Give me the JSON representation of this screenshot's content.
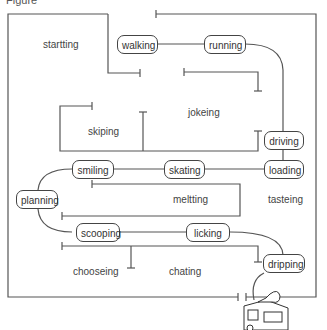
{
  "figure": {
    "title_cut": "Figure",
    "line_color": "#555555",
    "nodes": [
      {
        "id": "walking",
        "label": "walking"
      },
      {
        "id": "running",
        "label": "running"
      },
      {
        "id": "driving",
        "label": "driving"
      },
      {
        "id": "loading",
        "label": "loading"
      },
      {
        "id": "skating",
        "label": "skating"
      },
      {
        "id": "smiling",
        "label": "smiling"
      },
      {
        "id": "planning",
        "label": "planning"
      },
      {
        "id": "scooping",
        "label": "scooping"
      },
      {
        "id": "licking",
        "label": "licking"
      },
      {
        "id": "dripping",
        "label": "dripping"
      }
    ],
    "regions": [
      {
        "id": "startting",
        "label": "startting"
      },
      {
        "id": "jokeing",
        "label": "jokeing"
      },
      {
        "id": "skiping",
        "label": "skiping"
      },
      {
        "id": "meltting",
        "label": "meltting"
      },
      {
        "id": "tasteing",
        "label": "tasteing"
      },
      {
        "id": "chooseing",
        "label": "chooseing"
      },
      {
        "id": "chating",
        "label": "chating"
      }
    ],
    "icon": "ice-cream-truck-icon"
  }
}
